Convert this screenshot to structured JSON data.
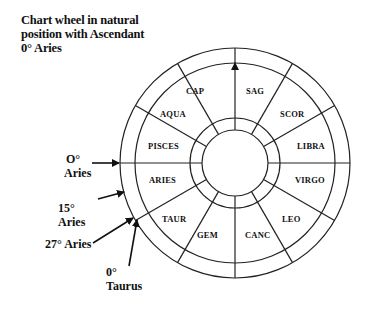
{
  "caption": {
    "lines": [
      "Chart wheel in natural",
      "position with Ascendant",
      "0° Aries"
    ]
  },
  "wheel": {
    "center": [
      235,
      163
    ],
    "outer_radius": 115,
    "ring_radius": 100,
    "inner_ring_outer_radius": 45,
    "inner_ring_inner_radius": 33,
    "signs": [
      {
        "label": "CAP",
        "x": 186,
        "y": 94
      },
      {
        "label": "SAG",
        "x": 246,
        "y": 94
      },
      {
        "label": "SCOR",
        "x": 280,
        "y": 117
      },
      {
        "label": "LIBRA",
        "x": 297,
        "y": 149
      },
      {
        "label": "VIRGO",
        "x": 295,
        "y": 183
      },
      {
        "label": "LEO",
        "x": 282,
        "y": 222
      },
      {
        "label": "CANC",
        "x": 245,
        "y": 238
      },
      {
        "label": "GEM",
        "x": 197,
        "y": 238
      },
      {
        "label": "TAUR",
        "x": 162,
        "y": 222
      },
      {
        "label": "ARIES",
        "x": 149,
        "y": 183
      },
      {
        "label": "PISCES",
        "x": 148,
        "y": 149
      },
      {
        "label": "AQUA",
        "x": 160,
        "y": 117
      }
    ]
  },
  "annotations": {
    "zero_aries": {
      "line1": "O°",
      "line2": "Aries"
    },
    "fifteen_aries": {
      "line1": "15°",
      "line2": "Aries"
    },
    "twentyseven_aries": {
      "line1": "27° Aries"
    },
    "zero_taurus": {
      "line1": "0°",
      "line2": "Taurus"
    }
  }
}
